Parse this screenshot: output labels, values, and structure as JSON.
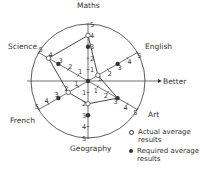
{
  "chart_data": {
    "type": "radar",
    "title": "",
    "scale": {
      "min": 0,
      "max": 5,
      "ticks": [
        1,
        2,
        3,
        4,
        5
      ]
    },
    "axes": [
      "Maths",
      "English",
      "Art",
      "Geography",
      "French",
      "Science"
    ],
    "direction_label": "Better",
    "series": [
      {
        "name": "Actual average results",
        "marker": "open-circle",
        "values": [
          4,
          1,
          3,
          2,
          2,
          4
        ]
      },
      {
        "name": "Required average results",
        "marker": "filled-circle",
        "values": [
          3,
          3,
          3,
          3,
          3,
          3
        ]
      }
    ]
  },
  "labels": {
    "maths": "Maths",
    "english": "English",
    "art": "Art",
    "geography": "Geography",
    "french": "French",
    "science": "Science",
    "better": "Better"
  },
  "legend": {
    "actual_line1": "Actual average",
    "actual_line2": "results",
    "required_line1": "Required average",
    "required_line2": "results"
  },
  "colors": {
    "line": "#333333",
    "background": "#ffffff"
  }
}
